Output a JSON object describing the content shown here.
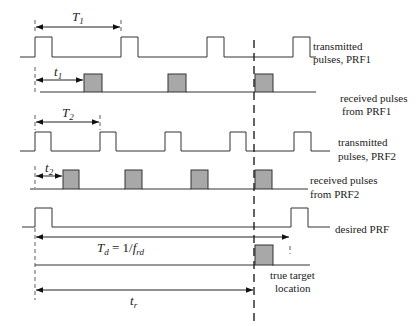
{
  "labels": {
    "tx_prf1_line1": "transmitted",
    "tx_prf1_line2": "pulses, PRF1",
    "rx_prf1_line1": "received pulses",
    "rx_prf1_line2": "from PRF1",
    "tx_prf2_line1": "transmitted",
    "tx_prf2_line2": "pulses, PRF2",
    "rx_prf2_line1": "received pulses",
    "rx_prf2_line2": "from PRF2",
    "desired_prf": "desired PRF",
    "target_line1": "true target",
    "target_line2": "location"
  },
  "math": {
    "T1": {
      "base": "T",
      "sub": "1"
    },
    "t1": {
      "base": "t",
      "sub": "1"
    },
    "T2": {
      "base": "T",
      "sub": "2"
    },
    "t2": {
      "base": "t",
      "sub": "2"
    },
    "Td": {
      "base": "T",
      "sub": "d",
      "rhs": " = 1/",
      "f": "f",
      "fsub": "rd"
    },
    "tr": {
      "base": "t",
      "sub": "r"
    }
  },
  "colors": {
    "received_pulse_fill": "#a8a8a8",
    "line": "#333333"
  }
}
